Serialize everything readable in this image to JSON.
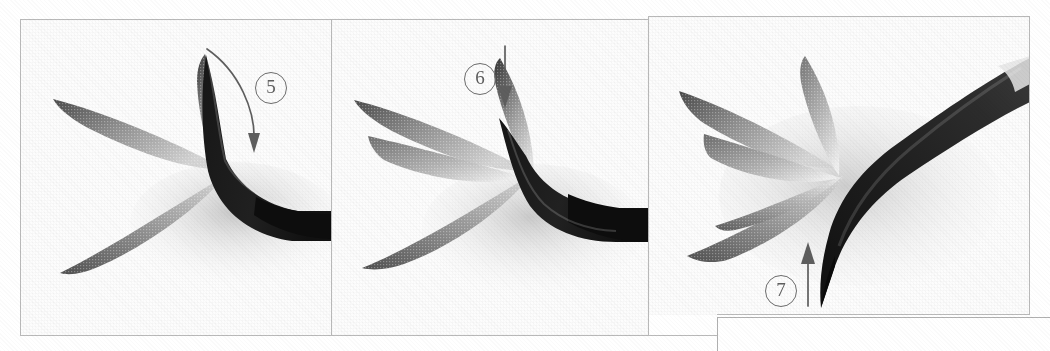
{
  "page": {
    "kind": "instructional-photo-sequence",
    "background_color": "#ffffff",
    "frame_color": "#b9b9b9",
    "ink_color": "#2b2b2b",
    "annotation_color": "#5e5e5e",
    "width": 1050,
    "height": 351
  },
  "panels": [
    {
      "id": "panel-5",
      "step_label": "5",
      "caption": "",
      "arrow": {
        "name": "curved-down-arrow",
        "direction": "curve-right-down",
        "description": "curved arrow sweeping from upper-left down to lower-right along the stroke"
      },
      "brush": {
        "orientation": "horizontal",
        "tip": "left",
        "handle": "right"
      },
      "leaves": 3
    },
    {
      "id": "panel-6",
      "step_label": "6",
      "caption": "",
      "arrow": {
        "name": "straight-down-arrow",
        "direction": "down",
        "description": "straight vertical arrow pointing downward"
      },
      "brush": {
        "orientation": "horizontal",
        "tip": "left",
        "handle": "right"
      },
      "leaves": 4
    },
    {
      "id": "panel-7",
      "step_label": "7",
      "caption": "",
      "arrow": {
        "name": "straight-up-arrow",
        "direction": "up",
        "description": "straight vertical arrow pointing upward"
      },
      "brush": {
        "orientation": "diagonal",
        "tip": "lower-left",
        "handle": "upper-right",
        "ferrule": "light band near upper-right"
      },
      "leaves": 5
    }
  ],
  "bottom_box": {
    "name": "continuation-box",
    "text": ""
  }
}
